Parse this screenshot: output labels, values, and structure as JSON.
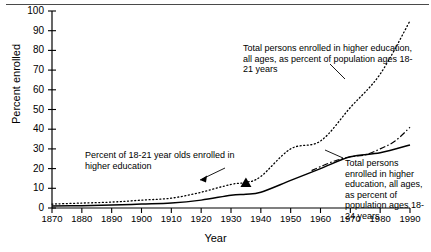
{
  "chart_data": {
    "type": "line",
    "title": "",
    "xlabel": "Year",
    "ylabel": "Percent enrolled",
    "xlim": [
      1870,
      1990
    ],
    "ylim": [
      0,
      100
    ],
    "grid": false,
    "legend_position": "annotations-inline",
    "xticks": [
      1870,
      1880,
      1890,
      1900,
      1910,
      1920,
      1930,
      1940,
      1950,
      1960,
      1970,
      1980,
      1990
    ],
    "yticks": [
      0,
      10,
      20,
      30,
      40,
      50,
      60,
      70,
      80,
      90,
      100
    ],
    "series": [
      {
        "name": "Total persons enrolled in higher education, all ages, as percent of population ages 18-21 years",
        "style": "dotted",
        "x": [
          1870,
          1880,
          1890,
          1900,
          1910,
          1920,
          1930,
          1935,
          1940,
          1950,
          1960,
          1970,
          1980,
          1990
        ],
        "values": [
          2,
          2.5,
          3,
          4,
          5,
          8,
          12,
          13,
          16,
          30,
          34,
          51,
          68,
          95
        ]
      },
      {
        "name": "Total persons enrolled in higher education, all ages, as percent of population ages 18-24 years",
        "style": "dash-dot",
        "x": [
          1957,
          1960,
          1965,
          1970,
          1975,
          1980,
          1985,
          1990
        ],
        "values": [
          19,
          21,
          24,
          26,
          27,
          30,
          34,
          41
        ]
      },
      {
        "name": "Percent of 18-21 year olds enrolled in higher education",
        "style": "solid",
        "x": [
          1870,
          1880,
          1890,
          1900,
          1910,
          1920,
          1930,
          1935,
          1940,
          1950,
          1960,
          1970,
          1980,
          1990
        ],
        "values": [
          1,
          1.2,
          1.5,
          2,
          2.5,
          4,
          6.5,
          7,
          8,
          14,
          20,
          26,
          28,
          32
        ]
      }
    ],
    "markers": [
      {
        "name": "triangle-marker",
        "x": 1935,
        "y": 13
      }
    ],
    "annotations": [
      {
        "id": "annot-top",
        "text": "Total persons enrolled in higher education, all ages, as percent of population ages 18-21 years"
      },
      {
        "id": "annot-left",
        "text": "Percent of 18-21 year olds enrolled in higher education"
      },
      {
        "id": "annot-right",
        "text": "Total persons enrolled in higher education, all ages, as percent of population ages 18-24 years"
      }
    ],
    "colors": {
      "axis": "#000000",
      "line": "#000000",
      "rule": "#4a4a4a",
      "background": "#ffffff"
    }
  },
  "axis": {
    "y_label": "Percent enrolled",
    "x_label": "Year",
    "y_tick_labels": [
      "100",
      "90",
      "80",
      "70",
      "60",
      "50",
      "40",
      "30",
      "20",
      "10",
      "0"
    ],
    "x_tick_labels": [
      "1870",
      "1880",
      "1890",
      "1900",
      "1910",
      "1920",
      "1930",
      "1940",
      "1950",
      "1960",
      "1970",
      "1980",
      "1990"
    ]
  },
  "annotations": {
    "top": "Total persons enrolled in higher education, all ages, as percent of population ages 18-21 years",
    "left": "Percent of 18-21 year olds enrolled in higher education",
    "right": "Total persons enrolled in higher education, all ages, as percent of population ages 18-24 years"
  }
}
